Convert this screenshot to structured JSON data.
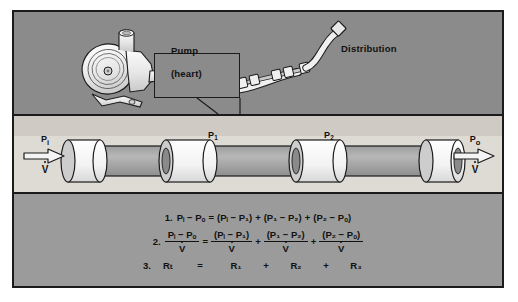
{
  "figure": {
    "colors": {
      "frame_border": "#1b1b1b",
      "top_panel_bg": "#8b8b8b",
      "mid_panel_bg": "#dedad4",
      "mid_panel_upper_bg": "#cfcbc4",
      "bottom_panel_bg": "#9b9b9b",
      "ink": "#111111",
      "tube_fill": "#a9a9a9",
      "tube_light": "#efefef"
    }
  },
  "top_panel": {
    "pump_label_line1": "Pump",
    "pump_label_line2": "(heart)",
    "distribution_label": "Distribution",
    "icons": {
      "pump": "pump-icon",
      "hose": "hose-icon",
      "segmented-tube": "segmented-tube-icon",
      "nozzle": "nozzle-icon",
      "callout": "callout-box"
    }
  },
  "tube_panel": {
    "pressure_labels": {
      "p1": "P",
      "p1_sub": "1",
      "p2": "P",
      "p2_sub": "2"
    },
    "resistance_labels": [
      {
        "base": "R",
        "sub": "1"
      },
      {
        "base": "R",
        "sub": "2"
      },
      {
        "base": "R",
        "sub": "3"
      }
    ],
    "inlet": {
      "pressure": "P",
      "pressure_sub": "i",
      "flow": "V",
      "arrow": "arrow-right-inlet"
    },
    "outlet": {
      "pressure": "P",
      "pressure_sub": "o",
      "flow": "V",
      "arrow": "arrow-right-outlet"
    }
  },
  "equations": {
    "eq1": {
      "number": "1.",
      "lhs": "Pᵢ − Pₒ",
      "eq": "=",
      "t1": "(Pᵢ − P₁)",
      "op1": "+",
      "t2": "(P₁ − P₂)",
      "op2": "+",
      "t3": "(P₂ − Pₒ)"
    },
    "eq2": {
      "number": "2.",
      "lhs_num": "Pᵢ − Pₒ",
      "lhs_den": "V",
      "eq": "=",
      "t1_num": "(Pᵢ − P₁)",
      "t1_den": "V",
      "op1": "+",
      "t2_num": "(P₁ − P₂)",
      "t2_den": "V",
      "op2": "+",
      "t3_num": "(P₂ − Pₒ)",
      "t3_den": "V"
    },
    "eq3": {
      "number": "3.",
      "lhs": "Rₜ",
      "eq": "=",
      "t1": "R₁",
      "op1": "+",
      "t2": "R₂",
      "op2": "+",
      "t3": "R₃"
    }
  }
}
